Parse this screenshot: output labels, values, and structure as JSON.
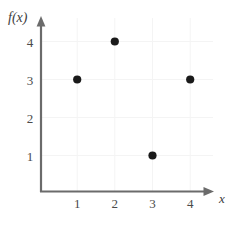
{
  "chart_data": {
    "type": "scatter",
    "title": "",
    "subtitle": "",
    "xlabel": "x",
    "ylabel": "f(x)",
    "x": [
      1,
      2,
      3,
      4
    ],
    "values": [
      3,
      4,
      1,
      3
    ],
    "points": [
      {
        "x": 1,
        "y": 3
      },
      {
        "x": 2,
        "y": 4
      },
      {
        "x": 3,
        "y": 1
      },
      {
        "x": 4,
        "y": 3
      }
    ],
    "xticks": [
      "1",
      "2",
      "3",
      "4"
    ],
    "yticks": [
      "1",
      "2",
      "3",
      "4"
    ],
    "xlim": [
      0,
      4.6
    ],
    "ylim": [
      0,
      4.6
    ],
    "grid": true,
    "legend": null,
    "annotations": [],
    "marker": "filled-circle",
    "colors": {
      "background": "#ffffff",
      "axis": "#6b6b6b",
      "marker": "#1a1a1a",
      "grid": "#f4f4f4",
      "text": "#4a4a4a"
    }
  },
  "axes": {
    "y_title": "f(x)",
    "x_title": "x"
  }
}
